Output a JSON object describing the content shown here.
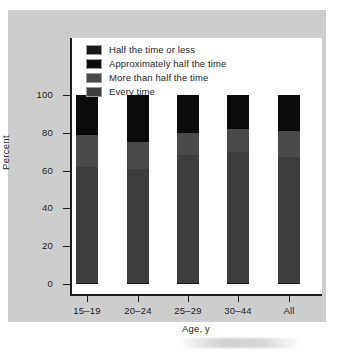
{
  "chart_data": {
    "type": "bar",
    "subtype": "stacked-bar-100",
    "title": "",
    "xlabel": "Age, y",
    "ylabel": "Percent",
    "ylim": [
      0,
      100
    ],
    "yticks": [
      0,
      20,
      40,
      60,
      80,
      100
    ],
    "ytick_labels": [
      "0",
      "20",
      "40",
      "60",
      "80",
      "100"
    ],
    "grid": false,
    "legend_position": "top-left-inside",
    "categories": [
      "15–19",
      "20–24",
      "25–29",
      "30–44",
      "All"
    ],
    "series": [
      {
        "name": "Every time",
        "color": "#3d3d3d",
        "values": [
          62,
          61,
          68,
          70,
          67
        ]
      },
      {
        "name": "More than half the time",
        "color": "#4a4a4a",
        "values": [
          17,
          14,
          12,
          12,
          14
        ]
      },
      {
        "name": "Approximately half the time",
        "color": "#0b0b0b",
        "values": [
          21,
          25,
          20,
          18,
          19
        ]
      },
      {
        "name": "Half the time or less",
        "color": "#1a1a1a",
        "values": [
          0,
          0,
          0,
          0,
          0
        ]
      }
    ],
    "legend_order_top_to_bottom": [
      "Half the time or less",
      "Approximately half the time",
      "More than half the time",
      "Every time"
    ]
  },
  "legend": {
    "items": [
      {
        "label": "Half the time or less",
        "color": "#1a1a1a"
      },
      {
        "label": "Approximately half the time",
        "color": "#0b0b0b"
      },
      {
        "label": "More than half the time",
        "color": "#4a4a4a"
      },
      {
        "label": "Every time",
        "color": "#3d3d3d"
      }
    ]
  },
  "axes": {
    "y_title": "Percent",
    "x_title": "Age, y",
    "y_tick_labels": [
      "100",
      "80",
      "60",
      "40",
      "20",
      "0"
    ],
    "x_tick_labels": [
      "15–19",
      "20–24",
      "25–29",
      "30–44",
      "All"
    ]
  },
  "colors": {
    "page_background": "#cdcdcd",
    "plot_background": "#ffffff",
    "axis": "#1c1c1c",
    "text": "#1d1d1d"
  }
}
